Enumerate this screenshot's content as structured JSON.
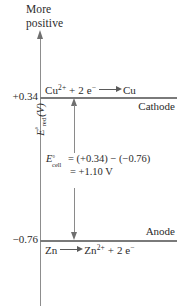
{
  "figure": {
    "type": "electrochemical-cell-potential-diagram",
    "caption_more_positive": "More\npositive",
    "y_axis_label": {
      "symbol": "E",
      "superscript": "°",
      "subscript": "red",
      "unit": "(V)",
      "full": "E°red (V)"
    },
    "levels": [
      {
        "id": "cathode",
        "value_label": "+0.34",
        "value": 0.34,
        "reaction_left": "Cu",
        "reaction_left_sup": "2+",
        "reaction_mid": " + 2 e",
        "reaction_mid_sup": "−",
        "reaction_right": "Cu",
        "electrode_label": "Cathode"
      },
      {
        "id": "anode",
        "value_label": "−0.76",
        "value": -0.76,
        "reaction_left": "Zn",
        "reaction_left_sup": "",
        "reaction_mid": "",
        "reaction_mid_sup": "",
        "reaction_right_a": "Zn",
        "reaction_right_a_sup": "2+",
        "reaction_right_b": " + 2 e",
        "reaction_right_b_sup": "−",
        "electrode_label": "Anode"
      }
    ],
    "cell_equation": {
      "symbol": "E",
      "superscript": "°",
      "subscript": "cell",
      "line1": "= (+0.34) − (−0.76)",
      "line2": "= +1.10 V",
      "result_value": 1.1,
      "result_unit": "V"
    },
    "colors": {
      "line": "#7a7a7a",
      "axis": "#8d8d8d",
      "text": "#2b2b2b",
      "background": "#ffffff"
    }
  },
  "chart_data": {
    "type": "bar",
    "xlabel": "",
    "ylabel": "E°red (V)",
    "categories": [
      "Cu2+ + 2 e- -> Cu (Cathode)",
      "Zn -> Zn2+ + 2 e- (Anode)"
    ],
    "values": [
      0.34,
      -0.76
    ],
    "tick_labels": [
      "+0.34",
      "−0.76"
    ],
    "annotations": [
      "More positive",
      "E°cell = (+0.34) − (−0.76) = +1.10 V"
    ],
    "grid": false,
    "legend": "none"
  }
}
